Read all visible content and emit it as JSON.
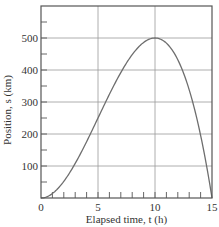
{
  "chart_data": {
    "type": "line",
    "title": "",
    "xlabel": "Elapsed time, t (h)",
    "ylabel": "Position, s (km)",
    "xlim": [
      0,
      15
    ],
    "ylim": [
      0,
      600
    ],
    "x_ticks": [
      0,
      5,
      10,
      15
    ],
    "x_tick_labels": [
      "0",
      "5",
      "10",
      "15"
    ],
    "x_minor_tick_step": 1,
    "y_ticks": [
      100,
      200,
      300,
      400,
      500
    ],
    "y_tick_labels": [
      "100",
      "200",
      "300",
      "400",
      "500"
    ],
    "y_minor_tick_step": 50,
    "grid": true,
    "legend": null,
    "series": [
      {
        "name": "s(t)",
        "x": [
          0,
          1,
          2,
          3,
          4,
          5,
          6,
          7,
          8,
          9,
          10,
          11,
          12,
          13,
          14,
          15
        ],
        "values": [
          0,
          14,
          52,
          108,
          176,
          250,
          324,
          392,
          448,
          486,
          500,
          484,
          432,
          338,
          196,
          0
        ]
      }
    ]
  },
  "labels": {
    "x_axis": "Elapsed time, t (h)",
    "y_axis": "Position, s (km)"
  },
  "colors": {
    "curve": "#6e6e6e",
    "grid": "#9a9a9a",
    "axis": "#555555",
    "text": "#333333"
  }
}
